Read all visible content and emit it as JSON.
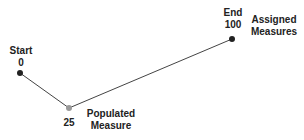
{
  "diagram": {
    "nodes": [
      {
        "id": "start",
        "label": "Start",
        "value": "0",
        "x": 20,
        "y": 73,
        "color": "#222222"
      },
      {
        "id": "populated",
        "label": "Populated Measure",
        "value": "25",
        "x": 69,
        "y": 108,
        "color": "#999999"
      },
      {
        "id": "end",
        "label": "End",
        "value": "100",
        "x": 232,
        "y": 39,
        "color": "#222222"
      }
    ],
    "start": {
      "title": "Start",
      "value": "0"
    },
    "populated": {
      "value": "25",
      "title_line1": "Populated",
      "title_line2": "Measure"
    },
    "end": {
      "title": "End",
      "value": "100",
      "side_line1": "Assigned",
      "side_line2": "Measures"
    }
  }
}
